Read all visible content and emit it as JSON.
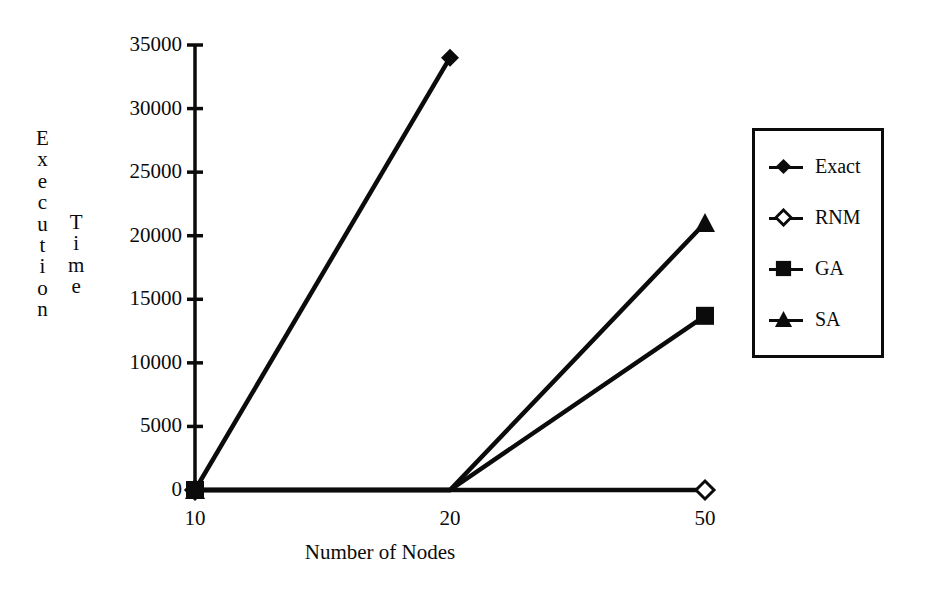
{
  "chart_data": {
    "type": "line",
    "title": "",
    "xlabel": "Number of Nodes",
    "ylabel": "Execution Time",
    "ylabel_stack_a": "Execution",
    "ylabel_stack_b": "Time",
    "categories": [
      "10",
      "20",
      "50"
    ],
    "x": [
      10,
      20,
      50
    ],
    "ylim": [
      0,
      35000
    ],
    "ytick_values": [
      0,
      5000,
      10000,
      15000,
      20000,
      25000,
      30000,
      35000
    ],
    "ytick_labels": [
      "0",
      "5000",
      "10000",
      "15000",
      "20000",
      "25000",
      "30000",
      "35000"
    ],
    "grid": false,
    "legend_position": "right",
    "series": [
      {
        "name": "Exact",
        "marker": "filled-diamond",
        "values": [
          0,
          34000,
          null
        ]
      },
      {
        "name": "RNM",
        "marker": "open-diamond",
        "values": [
          0,
          0,
          0
        ]
      },
      {
        "name": "GA",
        "marker": "filled-square",
        "values": [
          0,
          0,
          13700
        ]
      },
      {
        "name": "SA",
        "marker": "filled-triangle",
        "values": [
          0,
          0,
          21000
        ]
      }
    ]
  },
  "axes": {
    "y_labels": [
      {
        "value": 35000,
        "text": "35000"
      },
      {
        "value": 30000,
        "text": "30000"
      },
      {
        "value": 25000,
        "text": "25000"
      },
      {
        "value": 20000,
        "text": "20000"
      },
      {
        "value": 15000,
        "text": "15000"
      },
      {
        "value": 10000,
        "text": "10000"
      },
      {
        "value": 5000,
        "text": "5000"
      },
      {
        "value": 0,
        "text": "0"
      }
    ],
    "x_labels": [
      {
        "value": 10,
        "text": "10"
      },
      {
        "value": 20,
        "text": "20"
      },
      {
        "value": 50,
        "text": "50"
      }
    ],
    "x_axis_title": "Number of Nodes",
    "y_axis_title_part1": "Execution",
    "y_axis_title_part2": "Time"
  },
  "legend": {
    "items": [
      {
        "label": "Exact",
        "marker": "filled-diamond",
        "icon_name": "legend-marker-filled-diamond"
      },
      {
        "label": "RNM",
        "marker": "open-diamond",
        "icon_name": "legend-marker-open-diamond"
      },
      {
        "label": "GA",
        "marker": "filled-square",
        "icon_name": "legend-marker-filled-square"
      },
      {
        "label": "SA",
        "marker": "filled-triangle",
        "icon_name": "legend-marker-filled-triangle"
      }
    ]
  },
  "colors": {
    "ink": "#0b0b0b",
    "background": "#ffffff"
  }
}
